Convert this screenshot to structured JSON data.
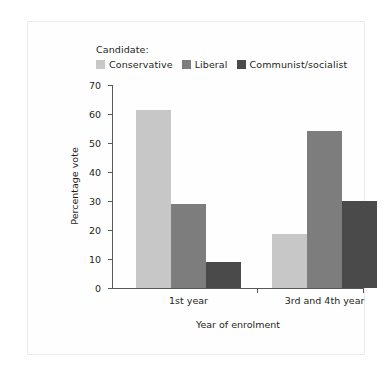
{
  "chart_data": {
    "type": "bar",
    "title": "",
    "xlabel": "Year of enrolment",
    "ylabel": "Percentage vote",
    "categories": [
      "1st year",
      "3rd and 4th year"
    ],
    "series": [
      {
        "name": "Conservative",
        "color": "#c7c7c7",
        "values": [
          61.5,
          18.5
        ]
      },
      {
        "name": "Liberal",
        "color": "#7d7d7d",
        "values": [
          29,
          54
        ]
      },
      {
        "name": "Communist/socialist",
        "color": "#4a4a4a",
        "values": [
          9,
          30
        ]
      }
    ],
    "ylim": [
      0,
      70
    ],
    "yticks": [
      0,
      10,
      20,
      30,
      40,
      50,
      60,
      70
    ],
    "ytick_labels": [
      "0",
      "10",
      "20",
      "30",
      "40",
      "50",
      "60",
      "70"
    ],
    "grid": false,
    "legend_position": "top-left",
    "legend_title": "Candidate:"
  }
}
